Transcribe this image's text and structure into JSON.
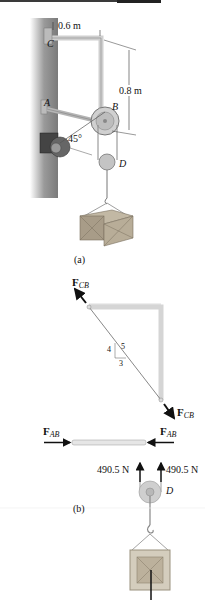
{
  "figure_a": {
    "caption": "(a)",
    "dim_horizontal": "0.6 m",
    "dim_vertical": "0.8 m",
    "angle": "45°",
    "points": {
      "C": "C",
      "A": "A",
      "B": "B",
      "D": "D"
    }
  },
  "figure_b": {
    "caption": "(b)",
    "force_cb_symbol": "F",
    "force_cb_sub": "CB",
    "force_ab_symbol": "F",
    "force_ab_sub": "AB",
    "slope": {
      "rise": "4",
      "hyp": "5",
      "run": "3"
    },
    "tension_left": "490.5 N",
    "tension_right": "490.5 N",
    "pulley_label": "D"
  },
  "colors": {
    "wall": "#8a8a8a",
    "frame": "#d9d9d9",
    "crate": "#a89c88",
    "arrow": "#111111"
  }
}
